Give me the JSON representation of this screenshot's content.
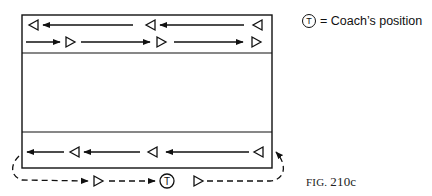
{
  "legend": {
    "symbol": "T",
    "text": "= Coach’s position"
  },
  "caption": {
    "prefix": "FIG.",
    "number": "210c"
  },
  "diagram": {
    "court": {
      "x": 22,
      "y": 15,
      "width": 250,
      "height": 153
    },
    "dividers_y": [
      53,
      132
    ],
    "top_zone": {
      "row1": {
        "direction": "left",
        "players": 3,
        "label": "players moving right-to-left"
      },
      "row2": {
        "direction": "right",
        "players": 3,
        "label": "players moving left-to-right"
      }
    },
    "bottom_zone": {
      "row1": {
        "direction": "left",
        "players": 3
      },
      "outside_row": {
        "direction": "right",
        "style": "dashed",
        "players": 2,
        "coach": "T"
      }
    },
    "colors": {
      "line": "#111111",
      "background": "#ffffff"
    }
  }
}
